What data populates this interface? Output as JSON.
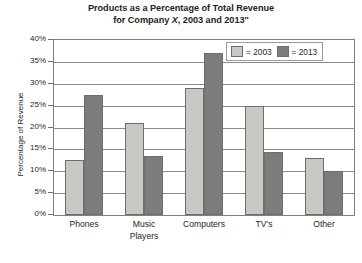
{
  "chart_data": {
    "type": "bar",
    "title": "Products as a Percentage of Total Revenue for Company X, 2003 and 2013\"",
    "title_line_1": "Products as a Percentage of Total Revenue",
    "title_line_2_before": "for Company ",
    "title_line_2_italic": "X",
    "title_line_2_after": ", 2003 and 2013\"",
    "xlabel": "",
    "ylabel": "Percentage of Revenue",
    "ylim": [
      0,
      40
    ],
    "ytick_values": [
      40,
      35,
      30,
      25,
      20,
      15,
      10,
      5,
      0
    ],
    "ytick_labels": [
      "40%",
      "35%",
      "30%",
      "25%",
      "20%",
      "15%",
      "10%",
      "5%",
      "0%"
    ],
    "grid": true,
    "legend_position": "top-right",
    "categories": [
      "Phones",
      "Music Players",
      "Computers",
      "TV's",
      "Other"
    ],
    "category_labels": [
      {
        "line1": "Phones",
        "line2": ""
      },
      {
        "line1": "Music",
        "line2": "Players"
      },
      {
        "line1": "Computers",
        "line2": ""
      },
      {
        "line1": "TV's",
        "line2": ""
      },
      {
        "line1": "Other",
        "line2": ""
      }
    ],
    "series": [
      {
        "name": "2003",
        "color": "#c9c9c4",
        "values": [
          12.5,
          21.0,
          29.0,
          25.0,
          13.0
        ]
      },
      {
        "name": "2013",
        "color": "#7c7c7c",
        "values": [
          27.5,
          13.5,
          37.0,
          14.5,
          10.0
        ]
      }
    ]
  },
  "legend": {
    "entries": [
      {
        "label": "= 2003",
        "series": "2003"
      },
      {
        "label": "= 2013",
        "series": "2013"
      }
    ]
  },
  "colors": {
    "series_2003": "#c9c9c4",
    "series_2013": "#7c7c7c",
    "axis": "#808080",
    "gridline": "#8a8a8a",
    "text": "#231f20",
    "background": "#ffffff"
  }
}
